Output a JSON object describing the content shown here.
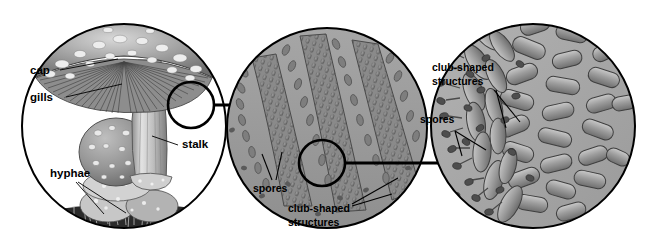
{
  "figure": {
    "type": "biological-diagram",
    "background_color": "#ffffff",
    "ink_color": "#000000"
  },
  "panels": [
    {
      "id": "whole-mushroom",
      "magnification_step": 1,
      "center": [
        124,
        126
      ],
      "radius": 103,
      "fill": "#ffffff",
      "description": "Whole warty-capped mushroom with gills, stalk and mycelial mat",
      "labels": [
        {
          "name": "cap",
          "text": "cap",
          "x": 30,
          "y": 74,
          "anchor": "start"
        },
        {
          "name": "gills",
          "text": "gills",
          "x": 30,
          "y": 101,
          "anchor": "start"
        },
        {
          "name": "stalk",
          "text": "stalk",
          "x": 182,
          "y": 148,
          "anchor": "start"
        },
        {
          "name": "hyphae",
          "text": "hyphae",
          "x": 50,
          "y": 177,
          "anchor": "start"
        }
      ]
    },
    {
      "id": "gill-cross-section",
      "magnification_step": 2,
      "center": [
        327,
        128
      ],
      "radius": 101,
      "fill": "#9b9b9b",
      "description": "Cross-section through gills showing palisade of club-shaped structures releasing spores",
      "labels": [
        {
          "name": "spores",
          "text": "spores",
          "x": 253,
          "y": 192,
          "anchor": "start"
        },
        {
          "name": "club-shaped-line-1",
          "text": "club-shaped",
          "x": 288,
          "y": 212,
          "anchor": "start"
        },
        {
          "name": "club-shaped-line-2",
          "text": "structures",
          "x": 288,
          "y": 226,
          "anchor": "start"
        }
      ]
    },
    {
      "id": "basidia-detail",
      "magnification_step": 3,
      "center": [
        533,
        126
      ],
      "radius": 103,
      "fill": "#a8a8a8",
      "description": "High magnification of club-shaped basidia bearing spores against packed hyphal cells",
      "labels": [
        {
          "name": "club-shaped-line-1",
          "text": "club-shaped",
          "x": 432,
          "y": 71,
          "anchor": "start"
        },
        {
          "name": "club-shaped-line-2",
          "text": "structures",
          "x": 432,
          "y": 85,
          "anchor": "start"
        },
        {
          "name": "spores",
          "text": "spores",
          "x": 420,
          "y": 123,
          "anchor": "start"
        }
      ]
    }
  ],
  "detail_circles": [
    {
      "name": "gill-detail-marker",
      "on_panel": "whole-mushroom",
      "center": [
        191,
        105
      ],
      "radius": 23
    },
    {
      "name": "basidia-detail-marker",
      "on_panel": "gill-cross-section",
      "center": [
        322,
        163
      ],
      "radius": 23
    }
  ],
  "arrows": [
    {
      "name": "arrow-panel1-to-panel2",
      "from": [
        214,
        105
      ],
      "to": [
        272,
        105
      ]
    },
    {
      "name": "arrow-panel2-to-panel3",
      "from": [
        345,
        163
      ],
      "to": [
        452,
        163
      ]
    }
  ],
  "terms": {
    "cap": "cap",
    "gills": "gills",
    "stalk": "stalk",
    "hyphae": "hyphae",
    "spores": "spores",
    "club_shaped_structures": "club-shaped structures"
  }
}
